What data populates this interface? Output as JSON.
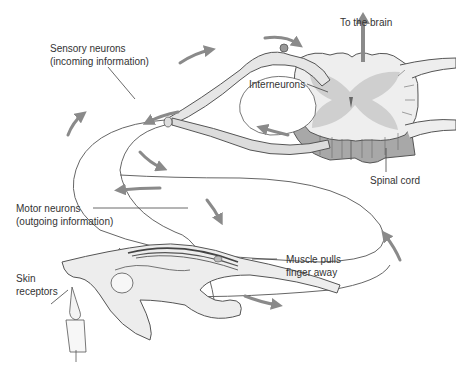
{
  "figure": {
    "labels": {
      "sensory_line1": "Sensory neurons",
      "sensory_line2": "(incoming information)",
      "to_brain": "To the brain",
      "interneurons": "Interneurons",
      "spinal_cord": "Spinal cord",
      "motor_line1": "Motor neurons",
      "motor_line2": "(outgoing information)",
      "muscle_line1": "Muscle pulls",
      "muscle_line2": "finger away",
      "skin_line1": "Skin",
      "skin_line2": "receptors"
    },
    "colors": {
      "line": "#555555",
      "arrow": "#8a8a8a",
      "gray_matter": "#cfcfcf",
      "white_matter": "#eeeeee",
      "dark_cord": "#9a9a9a",
      "label": "#333333"
    }
  }
}
